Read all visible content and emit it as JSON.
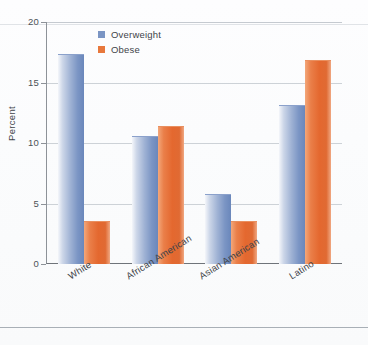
{
  "chart_data": {
    "type": "bar",
    "title": "",
    "xlabel": "",
    "ylabel": "Percent",
    "ylim": [
      0,
      20
    ],
    "yticks": [
      0,
      5,
      10,
      15,
      20
    ],
    "ytick_labels": [
      "0",
      "5",
      "10",
      "15",
      "20"
    ],
    "grid": true,
    "legend_position": "top-left-inside",
    "categories": [
      "White",
      "African American",
      "Asian American",
      "Latino"
    ],
    "series": [
      {
        "name": "Overweight",
        "color": "#7b95c4",
        "values": [
          17.3,
          10.5,
          5.7,
          13.1
        ]
      },
      {
        "name": "Obese",
        "color": "#e8783c",
        "values": [
          3.5,
          11.3,
          3.5,
          16.8
        ]
      }
    ]
  },
  "axis": {
    "y_title": "Percent"
  },
  "legend": {
    "items": [
      {
        "label": "Overweight"
      },
      {
        "label": "Obese"
      }
    ]
  }
}
